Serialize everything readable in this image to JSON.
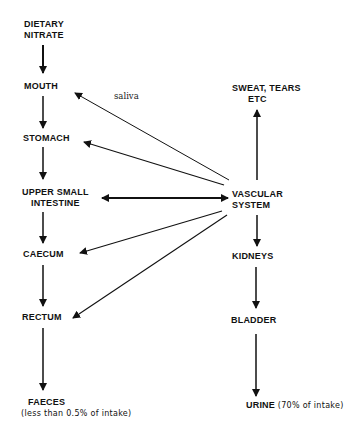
{
  "diagram": {
    "nodes": {
      "dietary_nitrate": {
        "line1": "DIETARY",
        "line2": "NITRATE"
      },
      "mouth": "MOUTH",
      "stomach": "STOMACH",
      "upper_small_intestine": {
        "line1": "UPPER SMALL",
        "line2": "INTESTINE"
      },
      "caecum": "CAECUM",
      "rectum": "RECTUM",
      "faeces": {
        "label": "FAECES",
        "note": "(less than 0.5% of intake)"
      },
      "sweat_tears": {
        "line1": "SWEAT, TEARS",
        "line2": "ETC"
      },
      "vascular_system": {
        "line1": "VASCULAR",
        "line2": "SYSTEM"
      },
      "kidneys": "KIDNEYS",
      "bladder": "BLADDER",
      "urine": {
        "label": "URINE",
        "note": "(70% of intake)"
      }
    },
    "edge_labels": {
      "saliva": "saliva"
    },
    "edges": [
      {
        "from": "DIETARY NITRATE",
        "to": "MOUTH"
      },
      {
        "from": "MOUTH",
        "to": "STOMACH"
      },
      {
        "from": "STOMACH",
        "to": "UPPER SMALL INTESTINE"
      },
      {
        "from": "UPPER SMALL INTESTINE",
        "to": "CAECUM"
      },
      {
        "from": "CAECUM",
        "to": "RECTUM"
      },
      {
        "from": "RECTUM",
        "to": "FAECES"
      },
      {
        "from": "VASCULAR SYSTEM",
        "to": "MOUTH",
        "label": "saliva"
      },
      {
        "from": "VASCULAR SYSTEM",
        "to": "STOMACH"
      },
      {
        "from": "VASCULAR SYSTEM",
        "to": "UPPER SMALL INTESTINE",
        "bidirectional": true
      },
      {
        "from": "VASCULAR SYSTEM",
        "to": "CAECUM"
      },
      {
        "from": "VASCULAR SYSTEM",
        "to": "RECTUM"
      },
      {
        "from": "VASCULAR SYSTEM",
        "to": "SWEAT, TEARS ETC"
      },
      {
        "from": "VASCULAR SYSTEM",
        "to": "KIDNEYS"
      },
      {
        "from": "KIDNEYS",
        "to": "BLADDER"
      },
      {
        "from": "BLADDER",
        "to": "URINE"
      }
    ]
  }
}
